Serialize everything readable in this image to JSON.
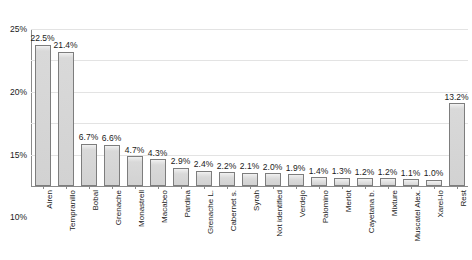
{
  "chart_data": {
    "type": "bar",
    "title": "",
    "subtitle": "",
    "xlabel": "",
    "ylabel": "",
    "ylim": [
      0,
      25
    ],
    "y_unit": "%",
    "grid": true,
    "legend": false,
    "orientation": "vertical",
    "y_ticks": [
      "0%",
      "5%",
      "10%",
      "15%",
      "20%",
      "25%"
    ],
    "y_tick_values": [
      0,
      5,
      10,
      15,
      20,
      25
    ],
    "categories": [
      "Airen",
      "Tempranillo",
      "Bobal",
      "Grenache",
      "Monastrell",
      "Macabeo",
      "Pardina",
      "Grenache L.",
      "Cabernet s.",
      "Syrah",
      "Not identified",
      "Verdejo",
      "Palomino",
      "Merlot",
      "Cayetana b.",
      "Mixture",
      "Muscatel Alex.",
      "Xarel-lo",
      "Rest"
    ],
    "values": [
      22.5,
      21.4,
      6.7,
      6.6,
      4.7,
      4.3,
      2.9,
      2.4,
      2.2,
      2.1,
      2.0,
      1.9,
      1.4,
      1.3,
      1.2,
      1.2,
      1.1,
      1.0,
      13.2
    ],
    "value_labels": [
      "22.5%",
      "21.4%",
      "6.7%",
      "6.6%",
      "4.7%",
      "4.3%",
      "2.9%",
      "2.4%",
      "2.2%",
      "2.1%",
      "2.0%",
      "1.9%",
      "1.4%",
      "1.3%",
      "1.2%",
      "1.2%",
      "1.1%",
      "1.0%",
      "13.2%"
    ],
    "colors": {
      "bar_fill": "#d4d4d4",
      "bar_border": "#7d7d7d",
      "gridline": "#e3e3e3",
      "axis": "#8a8a8a",
      "text": "#1a1a1a",
      "background": "#ffffff"
    }
  }
}
